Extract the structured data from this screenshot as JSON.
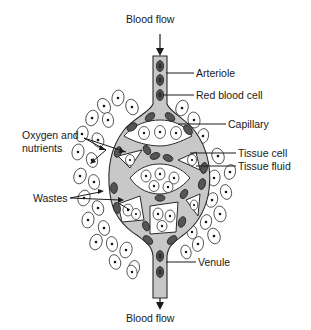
{
  "figure": {
    "title_top": "Blood flow",
    "title_bottom": "Blood flow",
    "labels": {
      "arteriole": "Arteriole",
      "red_blood_cell": "Red blood cell",
      "capillary": "Capillary",
      "tissue_cell": "Tissue cell",
      "tissue_fluid": "Tissue fluid",
      "oxygen_line1": "Oxygen and",
      "oxygen_line2": "nutrients",
      "wastes": "Wastes",
      "venule": "Venule"
    },
    "colors": {
      "vessel_fill": "#c8c8c8",
      "red_blood_cell": "#555555",
      "outline": "#2a2a2a",
      "background": "#ffffff"
    }
  }
}
